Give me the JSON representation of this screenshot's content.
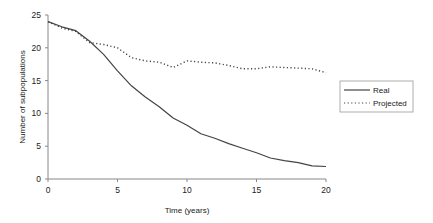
{
  "chart_data": {
    "type": "line",
    "title": "",
    "xlabel": "Time (years)",
    "ylabel": "Number of subpopulations",
    "xlim": [
      0,
      20
    ],
    "ylim": [
      0,
      25
    ],
    "xticks": [
      0,
      5,
      10,
      15,
      20
    ],
    "yticks": [
      0,
      5,
      10,
      15,
      20,
      25
    ],
    "grid": false,
    "legend_position": "right",
    "x": [
      0,
      1,
      2,
      3,
      4,
      5,
      6,
      7,
      8,
      9,
      10,
      11,
      12,
      13,
      14,
      15,
      16,
      17,
      18,
      19,
      20
    ],
    "series": [
      {
        "name": "Real",
        "style": "solid",
        "color": "#444444",
        "values": [
          24,
          23.2,
          22.6,
          21,
          19,
          16.5,
          14.2,
          12.5,
          11,
          9.3,
          8.2,
          6.9,
          6.2,
          5.4,
          4.7,
          4,
          3.2,
          2.8,
          2.5,
          2,
          1.9
        ]
      },
      {
        "name": "Projected",
        "style": "dotted",
        "color": "#444444",
        "values": [
          24,
          23,
          22.5,
          20.8,
          20.5,
          20,
          18.5,
          18,
          17.8,
          17,
          18,
          17.8,
          17.7,
          17.3,
          16.8,
          16.8,
          17.1,
          17,
          16.9,
          16.8,
          16.2
        ]
      }
    ]
  }
}
